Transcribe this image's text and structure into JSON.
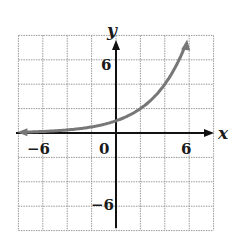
{
  "chart_data": {
    "type": "line",
    "title": "",
    "xlabel": "x",
    "ylabel": "y",
    "xlim": [
      -8,
      8
    ],
    "ylim": [
      -8,
      8
    ],
    "grid": true,
    "grid_step": 2,
    "x_ticks": [
      {
        "value": -6,
        "label": "−6"
      },
      {
        "value": 0,
        "label": "0"
      },
      {
        "value": 6,
        "label": "6"
      }
    ],
    "y_ticks": [
      {
        "value": 6,
        "label": "6"
      },
      {
        "value": -6,
        "label": "−6"
      }
    ],
    "series": [
      {
        "name": "y = 2^(x/2)",
        "color": "#777777",
        "x": [
          -8,
          -6,
          -4,
          -2,
          0,
          1,
          2,
          3,
          4,
          5,
          5.8
        ],
        "y": [
          0.0625,
          0.125,
          0.25,
          0.5,
          1,
          1.41,
          2,
          2.83,
          4,
          5.66,
          8
        ]
      }
    ]
  },
  "labels": {
    "x_axis": "x",
    "y_axis": "y",
    "x_tick_neg6": "−6",
    "x_tick_0": "0",
    "x_tick_6": "6",
    "y_tick_6": "6",
    "y_tick_neg6": "−6"
  }
}
